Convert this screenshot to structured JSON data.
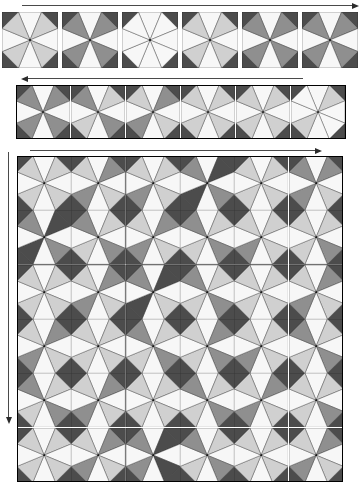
{
  "figure": {
    "type": "diagram",
    "width": 358,
    "height": 445,
    "background": "#ffffff"
  },
  "palette": {
    "dark": "#4c4c4c",
    "frame": "#4c4c4c",
    "mid": "#8f8f8f",
    "light": "#d0d0d0",
    "white": "#f7f7f7",
    "outline": "#2b2b2b",
    "arrow": "#3a3a3a"
  },
  "legend_wedge_codes": {
    "W": "white",
    "L": "light-gray",
    "M": "medium-gray",
    "D": "dark-gray"
  },
  "arrows": [
    {
      "name": "top-arrow",
      "direction": "right",
      "x": 22,
      "y": 5,
      "length": 330
    },
    {
      "name": "middle-arrow",
      "direction": "left",
      "x": 28,
      "y": 78,
      "length": 275
    },
    {
      "name": "grid-top-arrow",
      "direction": "right",
      "x": 30,
      "y": 150,
      "length": 285
    },
    {
      "name": "grid-left-arrow",
      "direction": "down",
      "x": 8,
      "y": 152,
      "length": 265
    }
  ],
  "rows": {
    "top_strip": {
      "name": "tile-palette-row",
      "x": 2,
      "y": 12,
      "tile_size": 56,
      "gap": 4,
      "count": 6,
      "tiles": [
        {
          "id": "t1",
          "wedges": [
            "W",
            "L",
            "W",
            "L",
            "W",
            "L",
            "W",
            "L"
          ],
          "corners": [
            "D",
            "D",
            "D",
            "D"
          ]
        },
        {
          "id": "t2",
          "wedges": [
            "W",
            "M",
            "W",
            "M",
            "W",
            "M",
            "W",
            "M"
          ],
          "corners": [
            "D",
            "D",
            "D",
            "D"
          ]
        },
        {
          "id": "t3",
          "wedges": [
            "W",
            "W",
            "W",
            "W",
            "W",
            "W",
            "W",
            "W"
          ],
          "corners": [
            "D",
            "D",
            "D",
            "D"
          ]
        },
        {
          "id": "t4",
          "wedges": [
            "W",
            "L",
            "W",
            "L",
            "W",
            "L",
            "W",
            "L"
          ],
          "corners": [
            "D",
            "D",
            "D",
            "D"
          ]
        },
        {
          "id": "t5",
          "wedges": [
            "W",
            "M",
            "W",
            "M",
            "W",
            "M",
            "W",
            "M"
          ],
          "corners": [
            "D",
            "D",
            "D",
            "D"
          ]
        },
        {
          "id": "t6",
          "wedges": [
            "W",
            "M",
            "W",
            "M",
            "W",
            "M",
            "W",
            "M"
          ],
          "corners": [
            "D",
            "D",
            "D",
            "D"
          ]
        }
      ]
    },
    "middle_strip": {
      "name": "tile-sequence-row",
      "x": 16,
      "y": 85,
      "tile_size": 54,
      "gap": 1,
      "count": 6,
      "tiles": [
        {
          "id": "m1",
          "wedges": [
            "W",
            "M",
            "W",
            "M",
            "W",
            "M",
            "W",
            "M"
          ],
          "corners": [
            "D",
            "D",
            "D",
            "D"
          ]
        },
        {
          "id": "m2",
          "wedges": [
            "W",
            "L",
            "W",
            "M",
            "W",
            "L",
            "W",
            "M"
          ],
          "corners": [
            "D",
            "D",
            "D",
            "D"
          ]
        },
        {
          "id": "m3",
          "wedges": [
            "W",
            "M",
            "W",
            "L",
            "W",
            "M",
            "W",
            "L"
          ],
          "corners": [
            "D",
            "D",
            "D",
            "D"
          ]
        },
        {
          "id": "m4",
          "wedges": [
            "W",
            "L",
            "W",
            "L",
            "W",
            "L",
            "W",
            "L"
          ],
          "corners": [
            "D",
            "D",
            "D",
            "D"
          ]
        },
        {
          "id": "m5",
          "wedges": [
            "W",
            "L",
            "W",
            "L",
            "W",
            "L",
            "W",
            "L"
          ],
          "corners": [
            "D",
            "D",
            "D",
            "D"
          ]
        },
        {
          "id": "m6",
          "wedges": [
            "W",
            "L",
            "W",
            "W",
            "W",
            "L",
            "W",
            "W"
          ],
          "corners": [
            "D",
            "D",
            "D",
            "D"
          ]
        }
      ]
    },
    "main_grid": {
      "name": "tiling-grid",
      "x": 17,
      "y": 156,
      "tile_size": 54.3,
      "cols": 6,
      "rows": 6,
      "cells": [
        [
          {
            "wedges": [
              "W",
              "L",
              "W",
              "L",
              "W",
              "L",
              "W",
              "L"
            ]
          },
          {
            "wedges": [
              "W",
              "M",
              "W",
              "L",
              "W",
              "M",
              "W",
              "L"
            ]
          },
          {
            "wedges": [
              "W",
              "L",
              "W",
              "L",
              "W",
              "M",
              "W",
              "L"
            ]
          },
          {
            "wedges": [
              "W",
              "D",
              "W",
              "M",
              "W",
              "D",
              "W",
              "M"
            ]
          },
          {
            "wedges": [
              "W",
              "L",
              "W",
              "L",
              "W",
              "L",
              "W",
              "L"
            ]
          },
          {
            "wedges": [
              "W",
              "M",
              "W",
              "L",
              "W",
              "M",
              "W",
              "M"
            ]
          }
        ],
        [
          {
            "wedges": [
              "W",
              "D",
              "W",
              "M",
              "W",
              "D",
              "W",
              "M"
            ]
          },
          {
            "wedges": [
              "W",
              "L",
              "W",
              "M",
              "W",
              "L",
              "W",
              "M"
            ]
          },
          {
            "wedges": [
              "W",
              "M",
              "W",
              "L",
              "W",
              "M",
              "W",
              "L"
            ]
          },
          {
            "wedges": [
              "W",
              "L",
              "W",
              "M",
              "W",
              "L",
              "W",
              "M"
            ]
          },
          {
            "wedges": [
              "W",
              "L",
              "W",
              "L",
              "W",
              "M",
              "W",
              "L"
            ]
          },
          {
            "wedges": [
              "W",
              "L",
              "W",
              "M",
              "W",
              "L",
              "W",
              "L"
            ]
          }
        ],
        [
          {
            "wedges": [
              "W",
              "L",
              "W",
              "L",
              "W",
              "L",
              "W",
              "L"
            ]
          },
          {
            "wedges": [
              "W",
              "M",
              "W",
              "L",
              "W",
              "M",
              "W",
              "L"
            ]
          },
          {
            "wedges": [
              "W",
              "D",
              "W",
              "L",
              "W",
              "D",
              "W",
              "M"
            ]
          },
          {
            "wedges": [
              "W",
              "L",
              "W",
              "M",
              "W",
              "L",
              "W",
              "M"
            ]
          },
          {
            "wedges": [
              "W",
              "L",
              "W",
              "L",
              "W",
              "L",
              "W",
              "L"
            ]
          },
          {
            "wedges": [
              "W",
              "M",
              "W",
              "L",
              "W",
              "M",
              "W",
              "L"
            ]
          }
        ],
        [
          {
            "wedges": [
              "W",
              "M",
              "W",
              "L",
              "W",
              "M",
              "W",
              "L"
            ]
          },
          {
            "wedges": [
              "W",
              "L",
              "W",
              "L",
              "W",
              "L",
              "W",
              "L"
            ]
          },
          {
            "wedges": [
              "W",
              "L",
              "W",
              "M",
              "W",
              "L",
              "W",
              "M"
            ]
          },
          {
            "wedges": [
              "W",
              "M",
              "W",
              "M",
              "W",
              "L",
              "W",
              "L"
            ]
          },
          {
            "wedges": [
              "W",
              "L",
              "W",
              "L",
              "W",
              "M",
              "W",
              "L"
            ]
          },
          {
            "wedges": [
              "W",
              "L",
              "W",
              "M",
              "W",
              "L",
              "W",
              "M"
            ]
          }
        ],
        [
          {
            "wedges": [
              "W",
              "L",
              "W",
              "M",
              "W",
              "L",
              "W",
              "M"
            ]
          },
          {
            "wedges": [
              "W",
              "M",
              "W",
              "L",
              "W",
              "M",
              "W",
              "L"
            ]
          },
          {
            "wedges": [
              "W",
              "L",
              "W",
              "L",
              "W",
              "L",
              "W",
              "L"
            ]
          },
          {
            "wedges": [
              "W",
              "L",
              "W",
              "M",
              "W",
              "L",
              "W",
              "M"
            ]
          },
          {
            "wedges": [
              "W",
              "M",
              "W",
              "L",
              "W",
              "M",
              "W",
              "L"
            ]
          },
          {
            "wedges": [
              "W",
              "L",
              "W",
              "M",
              "W",
              "L",
              "W",
              "L"
            ]
          }
        ],
        [
          {
            "wedges": [
              "W",
              "L",
              "W",
              "L",
              "W",
              "L",
              "W",
              "L"
            ]
          },
          {
            "wedges": [
              "W",
              "M",
              "W",
              "L",
              "W",
              "M",
              "W",
              "L"
            ]
          },
          {
            "wedges": [
              "W",
              "D",
              "W",
              "D",
              "W",
              "M",
              "W",
              "M"
            ]
          },
          {
            "wedges": [
              "W",
              "L",
              "W",
              "M",
              "W",
              "L",
              "W",
              "M"
            ]
          },
          {
            "wedges": [
              "W",
              "L",
              "W",
              "L",
              "W",
              "L",
              "W",
              "L"
            ]
          },
          {
            "wedges": [
              "W",
              "M",
              "W",
              "L",
              "W",
              "M",
              "W",
              "L"
            ]
          }
        ]
      ]
    }
  }
}
